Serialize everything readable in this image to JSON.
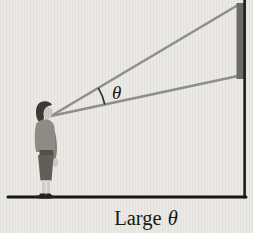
{
  "figure": {
    "angle_label": "θ",
    "caption_word": "Large",
    "caption_symbol": "θ"
  },
  "colors": {
    "background": "#eae9e6",
    "sight_line": "#908f8a",
    "object_bar": "#6d6b66",
    "frame_line": "#1c1b18",
    "ground_line": "#151410",
    "arc_line": "#33312c",
    "text": "#151410",
    "person_hair": "#3d3833",
    "person_skin": "#cfc8c0",
    "person_sweater": "#8f8c86",
    "person_arm": "#817e78",
    "person_belt": "#524f4a",
    "person_skirt": "#615d57",
    "person_legs": "#d2cec8",
    "person_shoes": "#22201c"
  }
}
